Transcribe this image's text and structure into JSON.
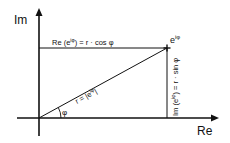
{
  "diagram": {
    "axis_y_label": "Im",
    "axis_x_label": "Re",
    "point_label_base": "e",
    "point_label_exp": "iφ",
    "real_part_label": "Re (e",
    "real_part_exp": "iφ",
    "real_part_rest": ") = r · cos φ",
    "imag_part_label": "Im (e",
    "imag_part_exp": "iφ",
    "imag_part_rest": ") = r · sin φ",
    "radius_label": "r = |e",
    "radius_exp": "iφ",
    "radius_rest": "|",
    "angle_label": "φ",
    "colors": {
      "stroke": "#111111",
      "background": "#ffffff"
    }
  }
}
